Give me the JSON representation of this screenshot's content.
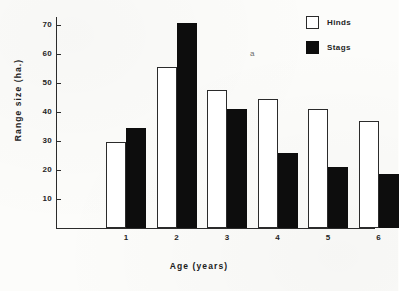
{
  "chart_data": {
    "type": "bar",
    "title": "",
    "xlabel": "Age (years)",
    "ylabel": "Range size (ha.)",
    "categories": [
      "1",
      "2",
      "3",
      "4",
      "5",
      "6"
    ],
    "series": [
      {
        "name": "Hinds",
        "color": "#ffffff",
        "values": [
          29.5,
          55.5,
          47.5,
          44.5,
          41.0,
          37.0
        ]
      },
      {
        "name": "Stags",
        "color": "#0d0d0d",
        "values": [
          34.5,
          70.5,
          41.0,
          26.0,
          21.0,
          18.7
        ]
      }
    ],
    "ylim": [
      0,
      72
    ],
    "y_ticks": [
      10,
      20,
      30,
      40,
      50,
      60,
      70
    ],
    "y_tick_labels": [
      "10",
      "20",
      "30",
      "40",
      "50",
      "60",
      "70"
    ],
    "grid": false,
    "legend_position": "top-right",
    "annotations": [
      {
        "text": "a",
        "x": 250,
        "y": 49
      }
    ]
  },
  "legend": {
    "items": [
      {
        "label": "Hinds",
        "swatch": "open-square"
      },
      {
        "label": "Stags",
        "swatch": "filled-square"
      }
    ]
  }
}
